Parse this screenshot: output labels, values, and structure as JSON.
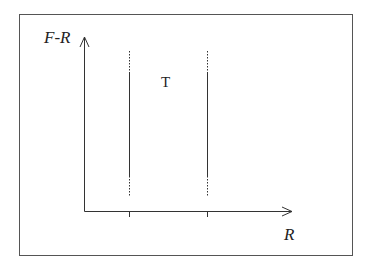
{
  "diagram": {
    "y_axis_label": "F-R",
    "x_axis_label": "R",
    "region_label": "T",
    "colors": {
      "background": "#ffffff",
      "stroke": "#333333",
      "frame": "#555555"
    },
    "vertical_lines": [
      {
        "x": 129,
        "dotted_top": [
          51,
          72
        ],
        "solid": [
          72,
          176
        ],
        "dotted_bottom": [
          176,
          196
        ]
      },
      {
        "x": 207,
        "dotted_top": [
          51,
          72
        ],
        "solid": [
          72,
          176
        ],
        "dotted_bottom": [
          176,
          196
        ]
      }
    ],
    "ticks_x": [
      129,
      207
    ]
  }
}
